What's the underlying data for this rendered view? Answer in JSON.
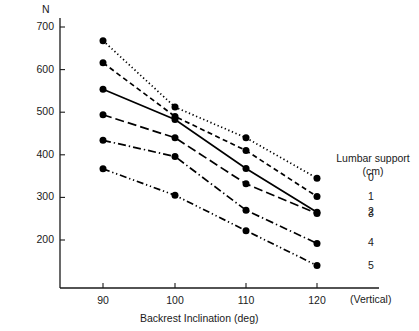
{
  "chart_data": {
    "type": "line",
    "title": "",
    "xlabel": "Backrest  Inclination (deg)",
    "ylabel": "N",
    "x": [
      90,
      100,
      110,
      120
    ],
    "xtick_labels": [
      "90",
      "100",
      "110",
      "120"
    ],
    "ytick_labels": [
      "700",
      "600",
      "500",
      "400",
      "300",
      "200"
    ],
    "yticks": [
      700,
      600,
      500,
      400,
      300,
      200
    ],
    "xlim": [
      85,
      125
    ],
    "ylim": [
      150,
      720
    ],
    "grid": false,
    "legend_position": "right",
    "legend_title": "Lumbar support",
    "legend_unit": "(cm)",
    "x_axis_end_note": "(Vertical)",
    "series": [
      {
        "name": "0",
        "style": "dotted",
        "values": [
          668,
          512,
          440,
          345
        ]
      },
      {
        "name": "1",
        "style": "dashed",
        "values": [
          616,
          490,
          410,
          302
        ]
      },
      {
        "name": "2",
        "style": "solid",
        "values": [
          554,
          483,
          368,
          265
        ]
      },
      {
        "name": "3",
        "style": "long-dash",
        "values": [
          494,
          440,
          332,
          262
        ]
      },
      {
        "name": "4",
        "style": "dash-dot",
        "values": [
          434,
          396,
          270,
          192
        ]
      },
      {
        "name": "5",
        "style": "dash-dot-dot",
        "values": [
          367,
          305,
          222,
          140
        ]
      }
    ]
  },
  "axes": {
    "y_unit_label": "N",
    "x_title": "Backrest  Inclination (deg)",
    "vertical_note": "(Vertical)"
  },
  "legend": {
    "title": "Lumbar support",
    "unit": "(cm)",
    "items": [
      "0",
      "1",
      "2",
      "3",
      "4",
      "5"
    ]
  }
}
